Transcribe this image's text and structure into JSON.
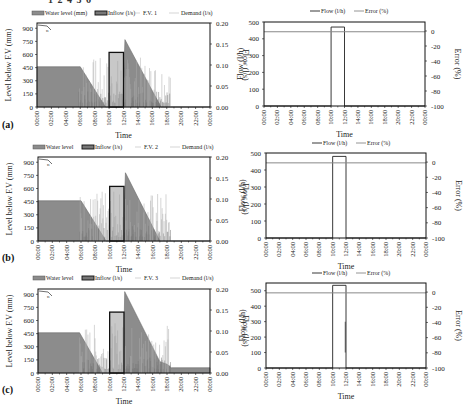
{
  "header": {
    "cut_text": "1 2 4 5 6"
  },
  "chart_data": [
    {
      "id": "a-left",
      "panel_label": "(a)",
      "type": "area",
      "title": "F.V. 1",
      "legend": [
        "Water level (mm)",
        "Inflow (l/s)",
        "F.V. 1",
        "Demand (l/s)"
      ],
      "xlabel": "Time",
      "ylabel": "Level below  F.V (mm)",
      "y2label": "Flow (l/s)",
      "x_ticks": [
        "00:00",
        "02:00",
        "04:00",
        "06:00",
        "08:00",
        "10:00",
        "12:00",
        "14:00",
        "16:00",
        "18:00",
        "20:00",
        "22:00",
        "00:00"
      ],
      "y_ticks": [
        0,
        150,
        300,
        450,
        600,
        750,
        900
      ],
      "y2_ticks": [
        "0.00",
        "0.05",
        "0.10",
        "0.15",
        "0.20"
      ],
      "ylim": [
        0,
        960
      ],
      "y2lim": [
        0,
        0.2
      ],
      "water_level": {
        "x": [
          0,
          6.0,
          9.5,
          10.0,
          11.9,
          12.2,
          17.2,
          18.5,
          24
        ],
        "y": [
          460,
          460,
          0,
          0,
          0,
          770,
          0,
          0,
          0
        ]
      },
      "inflow": {
        "x_start": 10.0,
        "x_end": 12.0,
        "value": 0.13
      },
      "demand_range_h": [
        5.8,
        18.5
      ]
    },
    {
      "id": "a-right",
      "type": "line",
      "legend": [
        "Flow (l/h)",
        "Error (%)"
      ],
      "xlabel": "Time",
      "ylabel": "Flow (l/h)",
      "y2label": "Error (%)",
      "x_ticks": [
        "00:00",
        "02:00",
        "04:00",
        "06:00",
        "08:00",
        "10:00",
        "12:00",
        "14:00",
        "16:00",
        "18:00",
        "20:00",
        "22:00",
        "00:00"
      ],
      "y_ticks": [
        0,
        100,
        200,
        300,
        400,
        500
      ],
      "y2_ticks": [
        0,
        -20,
        -40,
        -60,
        -80,
        -100
      ],
      "ylim": [
        0,
        500
      ],
      "y2lim": [
        -100,
        12
      ],
      "flow": {
        "x_start": 10.0,
        "x_end": 12.0,
        "value": 470
      },
      "error": {
        "value": -1
      }
    },
    {
      "id": "b-left",
      "panel_label": "(b)",
      "type": "area",
      "title": "F.V. 2",
      "legend": [
        "Water level",
        "Inflow (l/s)",
        "F.V. 2",
        "Demand (l/s)"
      ],
      "xlabel": "Time",
      "ylabel": "Level below  F.V (mm)",
      "y2label": "Flow (l/s)",
      "x_ticks": [
        "00:00",
        "02:00",
        "04:00",
        "06:00",
        "08:00",
        "10:00",
        "12:00",
        "14:00",
        "16:00",
        "18:00",
        "20:00",
        "22:00",
        "00:00"
      ],
      "y_ticks": [
        0,
        150,
        300,
        450,
        600,
        750,
        900
      ],
      "y2_ticks": [
        "0.00",
        "0.05",
        "0.10",
        "0.15",
        "0.20"
      ],
      "ylim": [
        0,
        960
      ],
      "y2lim": [
        0,
        0.2
      ],
      "water_level": {
        "x": [
          0,
          6.0,
          9.5,
          10.0,
          11.9,
          12.2,
          17.0,
          18.5,
          24
        ],
        "y": [
          460,
          460,
          0,
          0,
          0,
          780,
          0,
          0,
          0
        ]
      },
      "inflow": {
        "x_start": 10.0,
        "x_end": 12.0,
        "value": 0.13
      },
      "demand_range_h": [
        5.8,
        18.5
      ]
    },
    {
      "id": "b-right",
      "type": "line",
      "legend": [
        "Flow (l/h)",
        "Error (%)"
      ],
      "xlabel": "Time",
      "ylabel": "Flow (l/h)",
      "y2label": "Error (%)",
      "x_ticks": [
        "00:00",
        "02:00",
        "04:00",
        "06:00",
        "08:00",
        "10:00",
        "12:00",
        "14:00",
        "16:00",
        "18:00",
        "20:00",
        "22:00",
        "00:00"
      ],
      "y_ticks": [
        0,
        100,
        200,
        300,
        400,
        500
      ],
      "y2_ticks": [
        0,
        -20,
        -40,
        -60,
        -80,
        -100
      ],
      "ylim": [
        0,
        500
      ],
      "y2lim": [
        -100,
        12
      ],
      "flow": {
        "x_start": 10.0,
        "x_end": 12.0,
        "value": 480
      },
      "error": {
        "value": -1
      }
    },
    {
      "id": "c-left",
      "panel_label": "(c)",
      "type": "area",
      "title": "F.V. 3",
      "legend": [
        "Water level",
        "Inflow (l/s)",
        "F.V. 3",
        "Demand (l/s)"
      ],
      "xlabel": "Time",
      "ylabel": "Level below  F.V (mm)",
      "y2label": "Flow (l/s)",
      "x_ticks": [
        "00:00",
        "02:00",
        "04:00",
        "06:00",
        "08:00",
        "10:00",
        "12:00",
        "14:00",
        "16:00",
        "18:00",
        "20:00",
        "22:00",
        "00:00"
      ],
      "y_ticks": [
        0,
        150,
        300,
        450,
        600,
        750,
        900
      ],
      "y2_ticks": [
        "0.00",
        "0.05",
        "0.10",
        "0.15",
        "0.20"
      ],
      "ylim": [
        0,
        960
      ],
      "y2lim": [
        0,
        0.2
      ],
      "water_level": {
        "x": [
          0,
          5.8,
          9.0,
          10.0,
          11.9,
          12.1,
          17.0,
          18.0,
          18.6,
          24
        ],
        "y": [
          460,
          460,
          0,
          0,
          0,
          930,
          130,
          100,
          60,
          60
        ]
      },
      "inflow": {
        "x_start": 10.0,
        "x_end": 12.0,
        "value": 0.145
      },
      "demand_range_h": [
        5.8,
        18.5
      ]
    },
    {
      "id": "c-right",
      "type": "line",
      "legend": [
        "Flow (l/h)",
        "Error (%)"
      ],
      "xlabel": "Time",
      "ylabel": "Flow (l/h)",
      "y2label": "Error (%)",
      "x_ticks": [
        "00:00",
        "02:00",
        "04:00",
        "06:00",
        "08:00",
        "10:00",
        "12:00",
        "14:00",
        "16:00",
        "18:00",
        "20:00",
        "22:00",
        "00:00"
      ],
      "y_ticks": [
        0,
        100,
        200,
        300,
        400,
        500
      ],
      "y2_ticks": [
        0,
        -20,
        -40,
        -60,
        -80,
        -100
      ],
      "ylim": [
        0,
        550
      ],
      "y2lim": [
        -100,
        12
      ],
      "flow": {
        "x_start": 10.0,
        "x_end": 12.0,
        "value": 535
      },
      "error": {
        "value": -1,
        "spike_x": 11.9,
        "spike_range": [
          100,
          300
        ]
      }
    }
  ]
}
